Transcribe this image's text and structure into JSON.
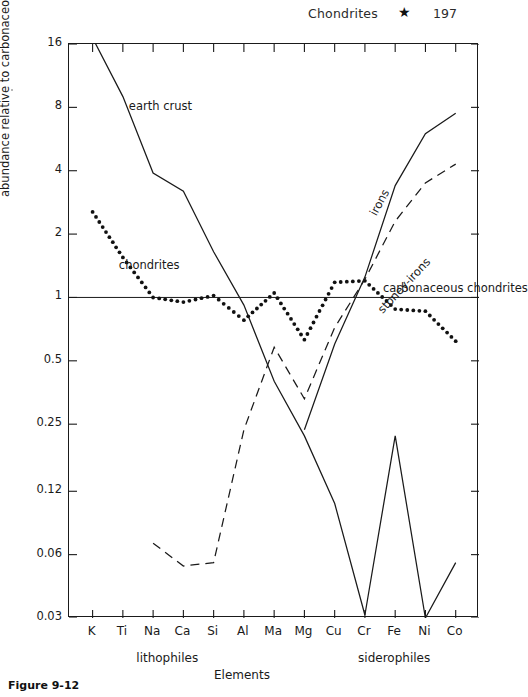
{
  "header": {
    "title": "Chondrites",
    "star_icon": "★",
    "number": "197"
  },
  "figure": {
    "caption": "Figure 9-12"
  },
  "chart_data": {
    "type": "line",
    "title": "",
    "xlabel": "Elements",
    "ylabel": "abundance relative to carbonaceous chondrites",
    "yscale": "log",
    "ylim": [
      0.03,
      16
    ],
    "grid": false,
    "legend": "in-plot annotations",
    "yticks": [
      "16",
      "8",
      "4",
      "2",
      "1",
      "0.5",
      "0.25",
      "0.12",
      "0.06",
      "0.03"
    ],
    "ytick_values": [
      16,
      8,
      4,
      2,
      1,
      0.5,
      0.25,
      0.12,
      0.06,
      0.03
    ],
    "categories": [
      "K",
      "Ti",
      "Na",
      "Ca",
      "Si",
      "Al",
      "Ma",
      "Mg",
      "Cu",
      "Cr",
      "Fe",
      "Ni",
      "Co"
    ],
    "category_groups": [
      {
        "label": "lithophiles",
        "from": "K",
        "to": "Al"
      },
      {
        "label": "siderophiles",
        "from": "Cu",
        "to": "Co"
      }
    ],
    "reference_line": {
      "label": "unity",
      "value": 1
    },
    "series": [
      {
        "name": "earth crust",
        "style": "solid",
        "values": [
          26.0,
          9.0,
          3.9,
          3.2,
          1.65,
          0.92,
          0.4,
          0.22,
          0.105,
          0.031,
          0.22,
          0.03,
          0.055
        ]
      },
      {
        "name": "chondrites",
        "style": "dotted",
        "values": [
          2.55,
          1.55,
          1.0,
          0.95,
          1.02,
          0.78,
          1.05,
          0.63,
          1.18,
          1.2,
          0.88,
          0.86,
          0.62
        ]
      },
      {
        "name": "carbonaceous chondrites",
        "style": "dotted-label",
        "values": [
          1,
          1,
          1,
          1,
          1,
          1,
          1,
          1,
          1,
          1,
          1,
          1,
          1
        ]
      },
      {
        "name": "irons",
        "style": "solid",
        "values": [
          null,
          null,
          null,
          null,
          null,
          null,
          null,
          0.235,
          0.6,
          1.25,
          3.4,
          6.0,
          7.5
        ]
      },
      {
        "name": "stoney-irons",
        "style": "dashed",
        "values": [
          null,
          null,
          0.068,
          0.053,
          0.055,
          0.235,
          0.58,
          0.33,
          0.72,
          1.22,
          2.3,
          3.5,
          4.3
        ]
      }
    ],
    "annotations": [
      {
        "text": "earth crust",
        "rotation": 0
      },
      {
        "text": "chondrites",
        "rotation": 0
      },
      {
        "text": "carbonaceous chondrites",
        "rotation": 0
      },
      {
        "text": "irons",
        "rotation": -60
      },
      {
        "text": "stoney-irons",
        "rotation": -45
      }
    ]
  }
}
